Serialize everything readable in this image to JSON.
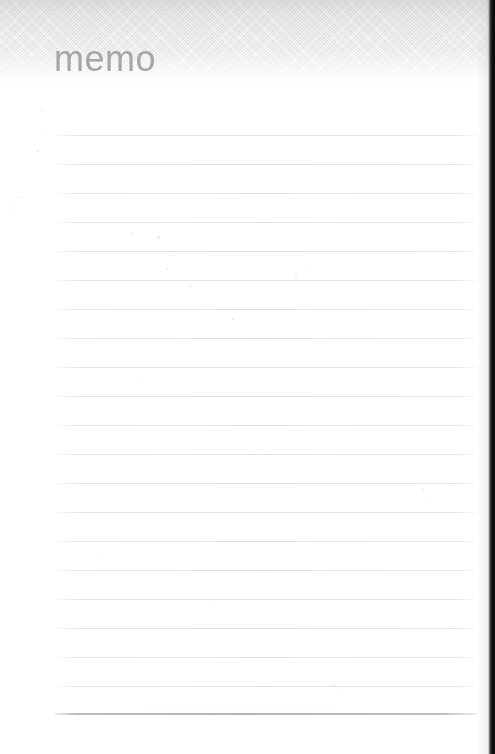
{
  "document": {
    "type": "memo-notepad-scan",
    "title": "memo",
    "width_px": 495,
    "height_px": 754
  },
  "header": {
    "title": "memo",
    "title_color": "#a6a6a8",
    "band_top_color": "#dedee0",
    "band_bottom_color": "#ffffff",
    "texture": "diagonal-crosshatch",
    "band_height_px": 84
  },
  "body": {
    "background_color": "#ffffff",
    "rule_color": "#e0e2e7",
    "last_rule_color": "#b2b4bb",
    "rule_left_px": 55,
    "rule_right_px": 477,
    "rules": [
      {
        "y": 135,
        "emphasis": "normal"
      },
      {
        "y": 164,
        "emphasis": "normal"
      },
      {
        "y": 193,
        "emphasis": "normal"
      },
      {
        "y": 222,
        "emphasis": "normal"
      },
      {
        "y": 251,
        "emphasis": "normal"
      },
      {
        "y": 280,
        "emphasis": "normal"
      },
      {
        "y": 309,
        "emphasis": "normal"
      },
      {
        "y": 338,
        "emphasis": "normal"
      },
      {
        "y": 367,
        "emphasis": "normal"
      },
      {
        "y": 396,
        "emphasis": "normal"
      },
      {
        "y": 425,
        "emphasis": "normal"
      },
      {
        "y": 454,
        "emphasis": "normal"
      },
      {
        "y": 483,
        "emphasis": "normal"
      },
      {
        "y": 512,
        "emphasis": "normal"
      },
      {
        "y": 541,
        "emphasis": "normal"
      },
      {
        "y": 570,
        "emphasis": "normal"
      },
      {
        "y": 599,
        "emphasis": "normal"
      },
      {
        "y": 628,
        "emphasis": "normal"
      },
      {
        "y": 657,
        "emphasis": "normal"
      },
      {
        "y": 686,
        "emphasis": "normal"
      },
      {
        "y": 713,
        "emphasis": "strong"
      }
    ],
    "specks": [
      {
        "x": 131,
        "y": 233,
        "size": 2.2
      },
      {
        "x": 157,
        "y": 236,
        "size": 2.6
      },
      {
        "x": 170,
        "y": 254,
        "size": 2.4
      },
      {
        "x": 166,
        "y": 268,
        "size": 1.8
      },
      {
        "x": 189,
        "y": 285,
        "size": 2.2
      },
      {
        "x": 295,
        "y": 277,
        "size": 1.6
      },
      {
        "x": 306,
        "y": 269,
        "size": 1.4
      },
      {
        "x": 41,
        "y": 110,
        "size": 2.0
      },
      {
        "x": 37,
        "y": 150,
        "size": 1.6
      },
      {
        "x": 20,
        "y": 196,
        "size": 1.8
      },
      {
        "x": 13,
        "y": 207,
        "size": 1.6
      },
      {
        "x": 44,
        "y": 130,
        "size": 1.4
      },
      {
        "x": 232,
        "y": 318,
        "size": 1.6
      },
      {
        "x": 422,
        "y": 489,
        "size": 1.8
      },
      {
        "x": 428,
        "y": 503,
        "size": 1.4
      },
      {
        "x": 303,
        "y": 625,
        "size": 1.8
      },
      {
        "x": 333,
        "y": 684,
        "size": 1.6
      },
      {
        "x": 342,
        "y": 690,
        "size": 1.4
      },
      {
        "x": 140,
        "y": 382,
        "size": 1.4
      },
      {
        "x": 96,
        "y": 557,
        "size": 1.4
      },
      {
        "x": 212,
        "y": 600,
        "size": 1.3
      },
      {
        "x": 452,
        "y": 398,
        "size": 1.3
      }
    ]
  },
  "scan_edge": {
    "position": "right",
    "color": "#0e0e10",
    "width_px": 8
  }
}
